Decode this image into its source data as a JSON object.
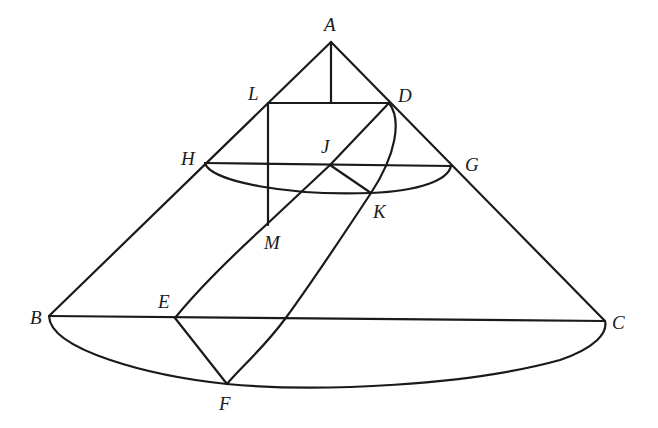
{
  "diagram": {
    "stroke_color": "#1a1a1a",
    "background": "#ffffff",
    "points": {
      "A": {
        "label": "A",
        "x": 331,
        "y": 42,
        "lx": 324,
        "ly": 31
      },
      "L": {
        "label": "L",
        "x": 268,
        "y": 103,
        "lx": 248,
        "ly": 100
      },
      "D": {
        "label": "D",
        "x": 389,
        "y": 103,
        "lx": 398,
        "ly": 102
      },
      "H": {
        "label": "H",
        "x": 205,
        "y": 163,
        "lx": 181,
        "ly": 165
      },
      "J": {
        "label": "J",
        "x": 330,
        "y": 165,
        "lx": 321,
        "ly": 153
      },
      "G": {
        "label": "G",
        "x": 451,
        "y": 166,
        "lx": 465,
        "ly": 171
      },
      "K": {
        "label": "K",
        "x": 371,
        "y": 193,
        "lx": 373,
        "ly": 218
      },
      "M": {
        "label": "M",
        "x": 266,
        "y": 225,
        "lx": 264,
        "ly": 249
      },
      "B": {
        "label": "B",
        "x": 49,
        "y": 316,
        "lx": 30,
        "ly": 324
      },
      "E": {
        "label": "E",
        "x": 175,
        "y": 318,
        "lx": 158,
        "ly": 308
      },
      "C": {
        "label": "C",
        "x": 605,
        "y": 321,
        "lx": 612,
        "ly": 329
      },
      "F": {
        "label": "F",
        "x": 227,
        "y": 384,
        "lx": 219,
        "ly": 410
      }
    },
    "segments": [
      {
        "name": "AB",
        "from": "A",
        "to": "B"
      },
      {
        "name": "AC",
        "from": "A",
        "to": "C"
      },
      {
        "name": "BC",
        "from": "B",
        "to": "C"
      },
      {
        "name": "HG",
        "from": "H",
        "to": "G"
      },
      {
        "name": "LD",
        "from": "L",
        "to": "D"
      },
      {
        "name": "A-to-LD-foot",
        "from": "A",
        "to": "foot"
      },
      {
        "name": "LM",
        "from": "L",
        "to": "M"
      },
      {
        "name": "DE",
        "from": "D",
        "to": "E"
      },
      {
        "name": "JK",
        "from": "J",
        "to": "K"
      },
      {
        "name": "EF",
        "from": "E",
        "to": "F"
      }
    ],
    "curves": [
      {
        "name": "lower-circle-arc-HG",
        "through": [
          "H",
          "K",
          "G"
        ]
      },
      {
        "name": "base-circle-arc-BC",
        "through": [
          "B",
          "F",
          "C"
        ]
      },
      {
        "name": "parabola-DKF",
        "through": [
          "D",
          "K",
          "F"
        ]
      }
    ]
  }
}
